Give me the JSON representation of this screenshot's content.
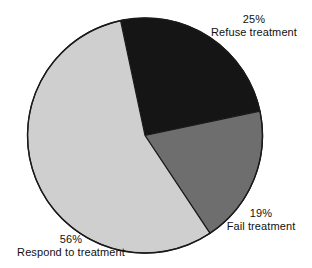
{
  "chart_data": {
    "type": "pie",
    "title": "",
    "subtitle": "",
    "xlabel": "",
    "ylabel": "",
    "legend_position": "none",
    "grid": false,
    "units": "percent",
    "start_angle_deg": -12,
    "direction": "clockwise",
    "categories": [
      "Refuse treatment",
      "Fail treatment",
      "Respond to treatment"
    ],
    "values": [
      25,
      19,
      56
    ],
    "slices": [
      {
        "label": "Refuse treatment",
        "value": 25,
        "value_text": "25%",
        "color": "#151515",
        "start_deg": -12,
        "end_deg": 78
      },
      {
        "label": "Fail treatment",
        "value": 19,
        "value_text": "19%",
        "color": "#6e6e6e",
        "start_deg": 78,
        "end_deg": 146.4
      },
      {
        "label": "Respond to treatment",
        "value": 56,
        "value_text": "56%",
        "color": "#cfcfcf",
        "start_deg": 146.4,
        "end_deg": 348
      }
    ],
    "outline_color": "#1a1a1a",
    "background_color": "#ffffff",
    "total": 100
  },
  "labels": {
    "refuse": {
      "percent": "25%",
      "name": "Refuse treatment"
    },
    "fail": {
      "percent": "19%",
      "name": "Fail treatment"
    },
    "respond": {
      "percent": "56%",
      "name": "Respond to treatment"
    }
  },
  "icons": {
    "pie": "pie-chart-icon"
  }
}
